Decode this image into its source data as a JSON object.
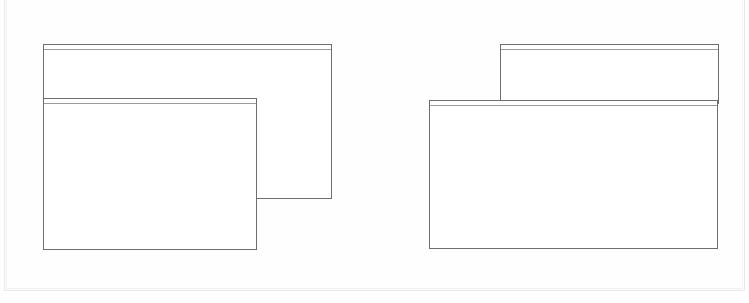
{
  "figure": {
    "background_color": "#fefefe",
    "line_color": "#6e6e6e",
    "accent_line_color": "#9a9a9a",
    "page_edge_color": "#e9e9e9",
    "width": 749,
    "height": 303
  },
  "groups": [
    {
      "name": "left-group",
      "arrangement": "front window anchored at same left edge, offset downward, partially covering the back window",
      "windows": [
        {
          "role": "back-window",
          "label": "",
          "titlebar_label": "",
          "x": 43,
          "y": 44,
          "width": 289,
          "height": 155
        },
        {
          "role": "front-window",
          "label": "",
          "titlebar_label": "",
          "x": 43,
          "y": 98,
          "width": 214,
          "height": 152
        }
      ]
    },
    {
      "name": "right-group",
      "arrangement": "front window anchored at same right edge, offset downward-left, covering the lower part of the back window",
      "windows": [
        {
          "role": "back-window",
          "label": "",
          "titlebar_label": "",
          "x": 500,
          "y": 44,
          "width": 219,
          "height": 60
        },
        {
          "role": "front-window",
          "label": "",
          "titlebar_label": "",
          "x": 429,
          "y": 100,
          "width": 289,
          "height": 149
        }
      ]
    }
  ]
}
